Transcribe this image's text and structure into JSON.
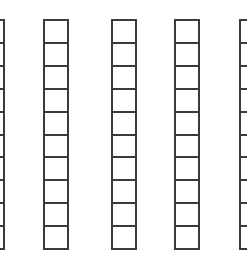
{
  "diagram": {
    "rod_count_visible": 5,
    "units_per_rod": 10,
    "line_color": "#3a3a3a",
    "background_color": "#ffffff",
    "rods": [
      {
        "id": "rod-1",
        "left": -21,
        "units": 10,
        "partially_visible": true
      },
      {
        "id": "rod-2",
        "left": 43,
        "units": 10,
        "partially_visible": false
      },
      {
        "id": "rod-3",
        "left": 111,
        "units": 10,
        "partially_visible": false
      },
      {
        "id": "rod-4",
        "left": 174,
        "units": 10,
        "partially_visible": false
      },
      {
        "id": "rod-5",
        "left": 239,
        "units": 10,
        "partially_visible": true
      }
    ]
  }
}
